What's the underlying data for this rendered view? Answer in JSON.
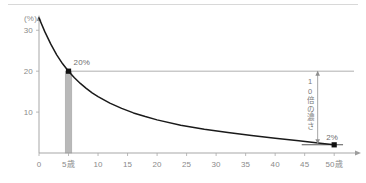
{
  "chart_data": {
    "type": "line",
    "title": "",
    "subtitle": "",
    "xlabel": "",
    "ylabel": "(%)",
    "x_unit_suffix": "歳",
    "xlim": [
      0,
      52
    ],
    "ylim": [
      0,
      33
    ],
    "grid": false,
    "legend": null,
    "x_ticks": [
      "0",
      "5",
      "10",
      "15",
      "20",
      "25",
      "30",
      "35",
      "40",
      "45",
      "50"
    ],
    "x_tick_values": [
      0,
      5,
      10,
      15,
      20,
      25,
      30,
      35,
      40,
      45,
      50
    ],
    "x_tick_special": {
      "5": "5歳",
      "50": "50歳"
    },
    "y_ticks": [
      "10",
      "20",
      "30"
    ],
    "y_tick_values": [
      10,
      20,
      30
    ],
    "series": [
      {
        "name": "decay-curve",
        "type": "line",
        "color": "#1a1a1a",
        "x": [
          0,
          1,
          2,
          3,
          4,
          5,
          6,
          7,
          8,
          9,
          10,
          12,
          14,
          16,
          18,
          20,
          24,
          28,
          32,
          36,
          40,
          44,
          48,
          50
        ],
        "values": [
          33.0,
          29.6,
          26.6,
          24.0,
          21.8,
          20.0,
          18.4,
          17.0,
          15.8,
          14.7,
          13.8,
          12.2,
          10.9,
          9.8,
          8.9,
          8.1,
          6.8,
          5.8,
          5.0,
          4.3,
          3.6,
          3.0,
          2.3,
          2.0
        ]
      }
    ],
    "bars": [
      {
        "name": "age-5-bar",
        "x": 5,
        "value": 20,
        "color": "#b9b9b9",
        "width_years": 1.1
      }
    ],
    "markers": [
      {
        "name": "marker-20-percent",
        "x": 5,
        "y": 20,
        "label": "20%",
        "color": "#111111"
      },
      {
        "name": "marker-2-percent",
        "x": 50,
        "y": 2,
        "label": "2%",
        "color": "#111111"
      }
    ],
    "annotations": [
      {
        "name": "label-20-percent",
        "text": "20%",
        "x": 5,
        "y": 20
      },
      {
        "name": "label-2-percent",
        "text": "2%",
        "x": 50,
        "y": 2
      },
      {
        "name": "ratio-note",
        "text": "10倍の濃さ",
        "orientation": "vertical"
      }
    ],
    "reference_lines": [
      {
        "name": "ref-line-20",
        "y": 20,
        "orientation": "horizontal",
        "color": "#9a9a9a"
      },
      {
        "name": "ref-line-2",
        "y": 2,
        "orientation": "horizontal",
        "color": "#555555"
      }
    ],
    "arrow": {
      "name": "ratio-arrow",
      "from_y": 20,
      "to_y": 2,
      "direction": "down"
    }
  },
  "axis": {
    "y_unit_label": "(%)",
    "x_axis_name": "axis-x",
    "y_axis_name": "axis-y"
  }
}
